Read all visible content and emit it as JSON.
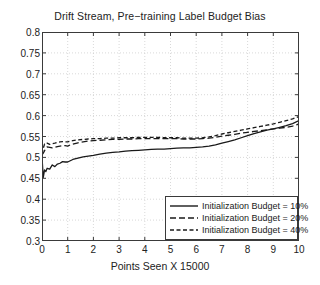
{
  "chart_data": {
    "type": "line",
    "title": "Drift Stream, Pre−training Label Budget Bias",
    "xlabel": "Points Seen X 15000",
    "ylabel": "",
    "xlim": [
      0,
      10
    ],
    "ylim": [
      0.3,
      0.8
    ],
    "grid": true,
    "grid_style": "dotted",
    "legend_position": "lower right",
    "xticks": [
      "0",
      "1",
      "2",
      "3",
      "4",
      "5",
      "6",
      "7",
      "8",
      "9",
      "10"
    ],
    "yticks": [
      "0.3",
      "0.35",
      "0.4",
      "0.45",
      "0.5",
      "0.55",
      "0.6",
      "0.65",
      "0.7",
      "0.75",
      "0.8"
    ],
    "x": [
      0,
      0.05,
      0.1,
      0.15,
      0.2,
      0.3,
      0.4,
      0.5,
      0.6,
      0.7,
      0.8,
      0.9,
      1.0,
      1.1,
      1.2,
      1.4,
      1.6,
      1.8,
      2.0,
      2.25,
      2.5,
      2.75,
      3.0,
      3.25,
      3.5,
      3.75,
      4.0,
      4.25,
      4.5,
      4.75,
      5.0,
      5.25,
      5.5,
      5.75,
      6.0,
      6.25,
      6.5,
      6.75,
      7.0,
      7.25,
      7.5,
      7.75,
      8.0,
      8.25,
      8.5,
      8.75,
      9.0,
      9.25,
      9.5,
      9.75,
      10.0
    ],
    "series": [
      {
        "name": "Initialization Budget = 10%",
        "style": "solid",
        "color": "#1a1a1a",
        "values": [
          0.5,
          0.452,
          0.47,
          0.466,
          0.474,
          0.472,
          0.482,
          0.478,
          0.484,
          0.486,
          0.49,
          0.489,
          0.489,
          0.492,
          0.495,
          0.498,
          0.501,
          0.503,
          0.505,
          0.508,
          0.51,
          0.512,
          0.513,
          0.515,
          0.516,
          0.517,
          0.518,
          0.519,
          0.52,
          0.52,
          0.521,
          0.522,
          0.523,
          0.523,
          0.524,
          0.525,
          0.527,
          0.53,
          0.534,
          0.538,
          0.542,
          0.547,
          0.552,
          0.557,
          0.561,
          0.565,
          0.568,
          0.572,
          0.576,
          0.581,
          0.588
        ]
      },
      {
        "name": "Initialization Budget = 20%",
        "style": "dashed",
        "color": "#1a1a1a",
        "values": [
          0.506,
          0.51,
          0.516,
          0.522,
          0.525,
          0.524,
          0.523,
          0.524,
          0.526,
          0.527,
          0.528,
          0.528,
          0.527,
          0.53,
          0.532,
          0.535,
          0.537,
          0.539,
          0.54,
          0.541,
          0.542,
          0.543,
          0.543,
          0.544,
          0.544,
          0.545,
          0.545,
          0.545,
          0.545,
          0.545,
          0.545,
          0.545,
          0.544,
          0.544,
          0.544,
          0.545,
          0.546,
          0.548,
          0.551,
          0.553,
          0.555,
          0.558,
          0.56,
          0.562,
          0.564,
          0.566,
          0.568,
          0.57,
          0.572,
          0.575,
          0.58
        ]
      },
      {
        "name": "Initialization Budget = 40%",
        "style": "dashed-tight",
        "color": "#1a1a1a",
        "values": [
          0.508,
          0.522,
          0.532,
          0.531,
          0.534,
          0.531,
          0.533,
          0.534,
          0.536,
          0.537,
          0.538,
          0.537,
          0.537,
          0.539,
          0.54,
          0.542,
          0.543,
          0.544,
          0.545,
          0.545,
          0.546,
          0.546,
          0.547,
          0.547,
          0.547,
          0.548,
          0.548,
          0.548,
          0.548,
          0.547,
          0.547,
          0.547,
          0.546,
          0.546,
          0.546,
          0.547,
          0.549,
          0.552,
          0.556,
          0.559,
          0.562,
          0.565,
          0.568,
          0.571,
          0.574,
          0.577,
          0.58,
          0.584,
          0.588,
          0.592,
          0.598
        ]
      }
    ]
  }
}
